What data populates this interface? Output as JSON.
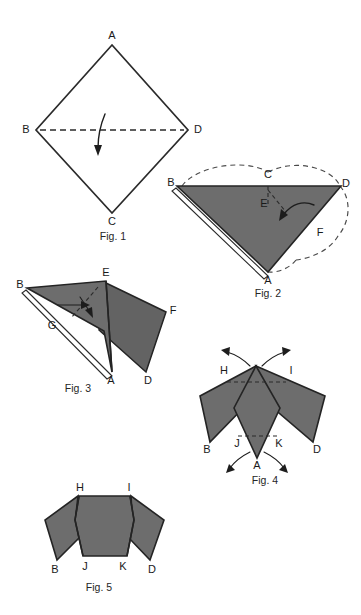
{
  "document": {
    "kind": "origami-folding-instruction-sheet",
    "figure_count": 5,
    "colors": {
      "paper_front": "#6d6d6d",
      "paper_back": "#ffffff",
      "ink": "#1a1a1a",
      "fold_line": "#2b2b2b",
      "ghost_line": "#4a4a4a"
    }
  },
  "figures": [
    {
      "id": "fig1",
      "caption": "Fig. 1",
      "description": "Square sheet held as a diamond, outline only, with horizontal valley fold from B to D and a downward fold arrow.",
      "vertices": [
        {
          "label": "A",
          "x": 112,
          "y": 37
        },
        {
          "label": "B",
          "x": 28,
          "y": 130
        },
        {
          "label": "C",
          "x": 112,
          "y": 219
        },
        {
          "label": "D",
          "x": 196,
          "y": 130
        }
      ],
      "fold_lines": [
        {
          "from": "B",
          "to": "D",
          "style": "dashed"
        }
      ],
      "arrows": [
        {
          "name": "fold-down-arrow",
          "direction": "down"
        }
      ]
    },
    {
      "id": "fig2",
      "caption": "Fig. 2",
      "description": "Folded triangle, shaded front face, with ghosted outline of the original diamond and a curved arrow folding the right flap inward.",
      "vertices": [
        {
          "label": "B",
          "x": 175,
          "y": 186
        },
        {
          "label": "C",
          "x": 268,
          "y": 176
        },
        {
          "label": "D",
          "x": 342,
          "y": 186
        },
        {
          "label": "E",
          "x": 266,
          "y": 203
        },
        {
          "label": "F",
          "x": 318,
          "y": 232
        },
        {
          "label": "A",
          "x": 268,
          "y": 272
        }
      ],
      "fold_lines": [
        {
          "from": "C",
          "to": "E",
          "style": "dashed"
        }
      ],
      "arrows": [
        {
          "name": "fold-left-curved-arrow",
          "direction": "left"
        }
      ]
    },
    {
      "id": "fig3",
      "caption": "Fig. 3",
      "description": "Partly folded model seen at an angle; left flap shaded with white under-edge, right flap folded out to F and D, dashed fold line through E.",
      "vertices": [
        {
          "label": "B",
          "x": 24,
          "y": 287
        },
        {
          "label": "E",
          "x": 106,
          "y": 277
        },
        {
          "label": "G",
          "x": 54,
          "y": 325
        },
        {
          "label": "F",
          "x": 169,
          "y": 311
        },
        {
          "label": "A",
          "x": 108,
          "y": 372
        },
        {
          "label": "D",
          "x": 148,
          "y": 377
        }
      ],
      "fold_lines": [
        {
          "from": "E",
          "to": "interior",
          "style": "dashed"
        }
      ],
      "arrows": [
        {
          "name": "fold-inward-arrow",
          "direction": "down-right"
        }
      ]
    },
    {
      "id": "fig4",
      "caption": "Fig. 4",
      "description": "Symmetric shaded form with two upper points H and I and two lower points B and D, dashed fold lines H-I and J-K, and four outward arrows at the tips.",
      "vertices": [
        {
          "label": "H",
          "x": 224,
          "y": 370
        },
        {
          "label": "I",
          "x": 290,
          "y": 370
        },
        {
          "label": "B",
          "x": 210,
          "y": 447
        },
        {
          "label": "J",
          "x": 239,
          "y": 441
        },
        {
          "label": "K",
          "x": 278,
          "y": 441
        },
        {
          "label": "D",
          "x": 313,
          "y": 447
        },
        {
          "label": "A",
          "x": 257,
          "y": 462
        }
      ],
      "fold_lines": [
        {
          "from": "H",
          "to": "I",
          "style": "dashed"
        },
        {
          "from": "J",
          "to": "K",
          "style": "dashed"
        }
      ],
      "arrows": [
        {
          "name": "tip-arrow-upper-left",
          "direction": "up-left"
        },
        {
          "name": "tip-arrow-upper-right",
          "direction": "up-right"
        },
        {
          "name": "tip-arrow-lower-left",
          "direction": "down-left"
        },
        {
          "name": "tip-arrow-lower-right",
          "direction": "down-right"
        }
      ]
    },
    {
      "id": "fig5",
      "caption": "Fig. 5",
      "description": "Finished flattened form: central shaded hexagonal body with H and I along the top edge, J and K along the bottom edge, and side flaps ending at points B and D.",
      "vertices": [
        {
          "label": "H",
          "x": 80,
          "y": 489
        },
        {
          "label": "I",
          "x": 129,
          "y": 489
        },
        {
          "label": "B",
          "x": 57,
          "y": 565
        },
        {
          "label": "J",
          "x": 85,
          "y": 563
        },
        {
          "label": "K",
          "x": 122,
          "y": 563
        },
        {
          "label": "D",
          "x": 150,
          "y": 565
        }
      ],
      "fold_lines": [],
      "arrows": []
    }
  ]
}
